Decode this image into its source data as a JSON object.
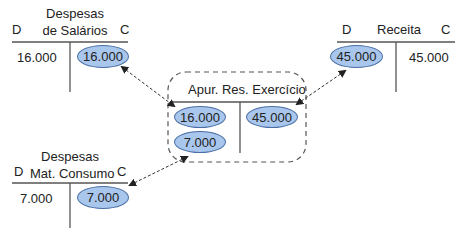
{
  "accounts": {
    "salarios": {
      "title_line1": "Despesas",
      "title_line2": "de Salários",
      "debit_label": "D",
      "credit_label": "C",
      "debit_value": "16.000",
      "credit_value": "16.000"
    },
    "receita": {
      "title": "Receita",
      "debit_label": "D",
      "credit_label": "C",
      "debit_value": "45.000",
      "credit_value": "45.000"
    },
    "consumo": {
      "title_line1": "Despesas",
      "title_line2": "Mat. Consumo",
      "debit_label": "D",
      "credit_label": "C",
      "debit_value": "7.000",
      "credit_value": "7.000"
    },
    "apuracao": {
      "title": "Apur. Res. Exercício",
      "debit_values": [
        "16.000",
        "7.000"
      ],
      "credit_values": [
        "45.000"
      ]
    }
  },
  "colors": {
    "ellipse_fill": "#a9c6ec",
    "ellipse_border": "#4a6fa5",
    "line": "#555555"
  }
}
